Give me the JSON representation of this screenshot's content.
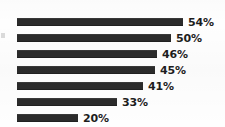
{
  "chart_data": {
    "type": "bar",
    "orientation": "horizontal",
    "title": "",
    "subtitle": "",
    "xlabel": "",
    "ylabel": "",
    "grid": false,
    "legend": null,
    "xlim": [
      0,
      60
    ],
    "categories": [
      "",
      "",
      "",
      "",
      "",
      "",
      ""
    ],
    "values": [
      54,
      50,
      46,
      45,
      41,
      33,
      20
    ],
    "data_labels": [
      "54%",
      "50%",
      "46%",
      "45%",
      "41%",
      "33%",
      "20%"
    ],
    "bar_color": "#2b2b2b",
    "label_color": "#1d1d1d",
    "background_color": "#fefefe",
    "bars": [
      {
        "value": 54,
        "label": "54%",
        "bar_px": 166,
        "top_px": 14
      },
      {
        "value": 50,
        "label": "50%",
        "bar_px": 154,
        "top_px": 30
      },
      {
        "value": 46,
        "label": "46%",
        "bar_px": 140,
        "top_px": 46
      },
      {
        "value": 45,
        "label": "45%",
        "bar_px": 138,
        "top_px": 62
      },
      {
        "value": 41,
        "label": "41%",
        "bar_px": 126,
        "top_px": 78
      },
      {
        "value": 33,
        "label": "33%",
        "bar_px": 100,
        "top_px": 94
      },
      {
        "value": 20,
        "label": "20%",
        "bar_px": 61,
        "top_px": 110
      }
    ],
    "bar_start_px": 17,
    "bar_thickness_px": 8
  }
}
